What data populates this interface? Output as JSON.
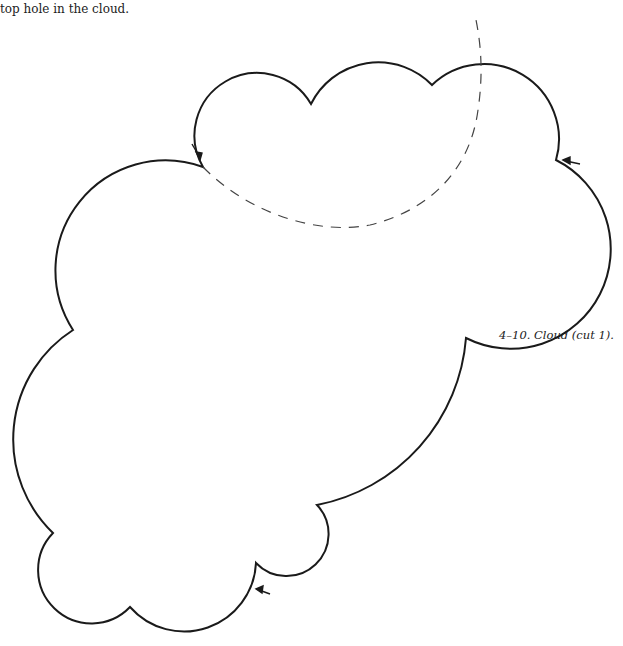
{
  "text": {
    "top_line": "top hole in the cloud.",
    "figure_caption": "4–10.  Cloud (cut 1)."
  },
  "diagram": {
    "shape": "cloud-outline",
    "stroke_color": "#1a1a1a",
    "dashed_line_color": "#444444",
    "arrows": 4
  }
}
